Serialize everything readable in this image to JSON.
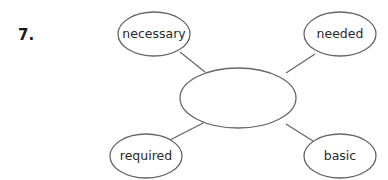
{
  "question": {
    "number": "7."
  },
  "word_web": {
    "center": {
      "value": "",
      "placeholder": ""
    },
    "nodes": [
      {
        "label": "necessary",
        "position": "top-left"
      },
      {
        "label": "needed",
        "position": "top-right"
      },
      {
        "label": "required",
        "position": "bottom-left"
      },
      {
        "label": "basic",
        "position": "bottom-right"
      }
    ]
  },
  "colors": {
    "stroke": "#666666",
    "text": "#2a2a2a",
    "number": "#1a1a1a",
    "background": "#ffffff"
  }
}
